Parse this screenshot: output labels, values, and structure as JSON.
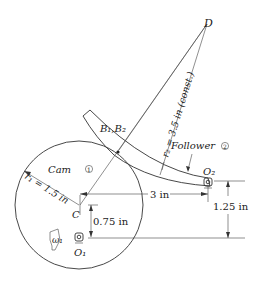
{
  "diagram": {
    "points": {
      "D": "D",
      "B": "B₁,B₂",
      "C": "C",
      "O1": "O₁",
      "O2": "O₂"
    },
    "labels": {
      "cam": "Cam",
      "cam_num": "1",
      "follower": "Follower",
      "follower_num": "2",
      "omega": "ω₁"
    },
    "dimensions": {
      "r1": "r₁ = 1.5 in",
      "r2": "r₂ = 3.5 in (const.)",
      "horizontal": "3 in",
      "c_offset": "0.75 in",
      "o2_height": "1.25 in"
    }
  }
}
